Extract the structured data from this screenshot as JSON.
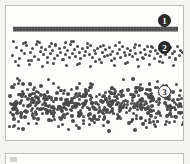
{
  "figure": {
    "panel_label": "scanned-figure-panel",
    "background_color": "#f4f4f2",
    "page_color": "#fdfdfc",
    "border_color": "#b9b9b6",
    "ink_color": "#4a4a4a"
  },
  "callouts": [
    {
      "id": "callout-1",
      "label": "1",
      "style": "filled",
      "refers_to": "solid-line-band"
    },
    {
      "id": "callout-2",
      "label": "2",
      "style": "filled",
      "refers_to": "sparse-scatter-band"
    },
    {
      "id": "callout-3",
      "label": "3",
      "style": "open",
      "refers_to": "dense-scatter-band"
    }
  ],
  "chart_data": {
    "type": "scatter",
    "title": "",
    "subtitle": "",
    "xlabel": "",
    "ylabel": "",
    "xlim": [
      0,
      179
    ],
    "ylim": [
      0,
      136
    ],
    "grid": false,
    "legend": "none",
    "annotations": [
      "1",
      "2",
      "3"
    ],
    "series": [
      {
        "name": "1",
        "render": "solid-bar",
        "marker_count": 1,
        "x_extent": [
          7,
          172
        ],
        "y_center": 22,
        "thickness": 4,
        "density": "continuous",
        "values": [
          22
        ]
      },
      {
        "name": "2",
        "render": "dots",
        "marker_count": 140,
        "x_extent": [
          4,
          175
        ],
        "y_extent": [
          34,
          60
        ],
        "density": "sparse",
        "marker_size": 3,
        "x": [
          5,
          9,
          12,
          14,
          17,
          19,
          21,
          23,
          25,
          27,
          29,
          31,
          33,
          34,
          36,
          38,
          40,
          42,
          43,
          45,
          47,
          48,
          50,
          52,
          53,
          55,
          57,
          58,
          60,
          62,
          63,
          65,
          67,
          68,
          70,
          72,
          73,
          75,
          77,
          78,
          80,
          82,
          83,
          85,
          87,
          88,
          90,
          92,
          93,
          95,
          97,
          98,
          100,
          102,
          103,
          105,
          107,
          108,
          110,
          112,
          113,
          115,
          117,
          118,
          120,
          122,
          123,
          125,
          127,
          128,
          130,
          132,
          133,
          135,
          137,
          138,
          140,
          142,
          143,
          145,
          147,
          148,
          150,
          152,
          153,
          155,
          157,
          158,
          160,
          162,
          163,
          165,
          167,
          168,
          170,
          172,
          173,
          175,
          8,
          16,
          24,
          32,
          40,
          48,
          56,
          64,
          72,
          80,
          88,
          96,
          104,
          112,
          120,
          128,
          136,
          144,
          152,
          160,
          168,
          11,
          22,
          35,
          46,
          59,
          70,
          83,
          94,
          107,
          118,
          131,
          142,
          155,
          166,
          6,
          18,
          30,
          44,
          58,
          66
        ],
        "y": [
          14,
          6,
          17,
          9,
          12,
          4,
          19,
          11,
          7,
          15,
          3,
          18,
          10,
          6,
          13,
          8,
          16,
          5,
          12,
          9,
          17,
          4,
          14,
          7,
          11,
          18,
          6,
          13,
          9,
          16,
          3,
          12,
          8,
          15,
          5,
          11,
          17,
          7,
          14,
          10,
          6,
          13,
          4,
          16,
          9,
          12,
          7,
          18,
          5,
          11,
          15,
          8,
          14,
          6,
          13,
          10,
          17,
          4,
          12,
          8,
          16,
          5,
          11,
          14,
          7,
          13,
          9,
          15,
          6,
          12,
          18,
          4,
          11,
          16,
          8,
          13,
          5,
          14,
          10,
          6,
          17,
          9,
          12,
          7,
          15,
          11,
          4,
          13,
          8,
          16,
          6,
          12,
          10,
          17,
          5,
          14,
          9,
          11,
          20,
          2,
          19,
          1,
          21,
          3,
          18,
          0,
          22,
          2,
          20,
          4,
          19,
          1,
          21,
          3,
          17,
          5,
          20,
          2,
          18,
          24,
          23,
          25,
          22,
          24,
          23,
          25,
          21,
          24,
          22,
          25,
          23,
          21,
          24,
          0,
          1,
          0,
          2,
          1,
          0
        ]
      },
      {
        "name": "3",
        "render": "dots",
        "marker_count": 520,
        "x_extent": [
          2,
          177
        ],
        "y_extent": [
          68,
          130
        ],
        "density": "dense",
        "marker_size": 3,
        "note": "overlapping dot cloud forming a near-solid band"
      }
    ]
  }
}
